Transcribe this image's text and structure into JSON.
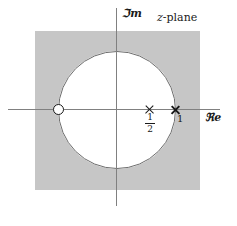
{
  "figure": {
    "title_label": "z-plane",
    "title_italic_part": "z",
    "title_rest": "-plane",
    "axis_im_label": "ℑm",
    "axis_re_label": "ℜe",
    "shading_color": "#c6c6c6",
    "circle_stroke_color": "#6d6d6d",
    "axis_color": "#808080",
    "marker_color": "#1a1a1a",
    "background_color": "#ffffff"
  },
  "annotations": {
    "pole_one_label": "1",
    "pole_half_numerator": "1",
    "pole_half_denominator": "2"
  },
  "chart_data": {
    "type": "scatter",
    "title": "z-plane",
    "xlabel": "ℜe",
    "ylabel": "ℑm",
    "grid": false,
    "legend": "none",
    "xlim": [
      -1.85,
      1.75
    ],
    "ylim": [
      -1.65,
      1.7
    ],
    "unit_circle": {
      "center": [
        0,
        0
      ],
      "radius": 1,
      "stroke": "#6d6d6d"
    },
    "shaded_region": {
      "description": "region of convergence: exterior of unit circle",
      "color": "#c6c6c6",
      "x_range": [
        -1.38,
        1.41
      ],
      "y_range": [
        -1.34,
        1.34
      ]
    },
    "series": [
      {
        "name": "zeros",
        "marker": "open-circle",
        "points": [
          {
            "label": "",
            "re": -1,
            "im": 0
          }
        ]
      },
      {
        "name": "poles",
        "marker": "cross",
        "points": [
          {
            "label": "1/2",
            "re": 0.5,
            "im": 0
          },
          {
            "label": "1",
            "re": 1,
            "im": 0
          }
        ]
      }
    ],
    "annotations": [
      {
        "text": "z-plane",
        "re": 1.0,
        "im": 1.62
      },
      {
        "text": "1/2",
        "re": 0.5,
        "im": -0.12
      },
      {
        "text": "1",
        "re": 1.04,
        "im": -0.1
      }
    ]
  }
}
